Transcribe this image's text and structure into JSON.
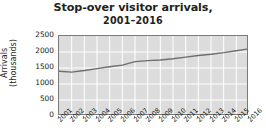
{
  "chart_data": {
    "type": "line",
    "title": "Stop-over visitor arrivals,",
    "subtitle": "2001–2016",
    "xlabel": "",
    "ylabel": "Arrivals",
    "ylabel_line2": "(thousands)",
    "categories": [
      "2001",
      "2002",
      "2003",
      "2004",
      "2005",
      "2006",
      "2007",
      "2008",
      "2009",
      "2010",
      "2011",
      "2012",
      "2013",
      "2014",
      "2015",
      "2016"
    ],
    "values": [
      1400,
      1370,
      1420,
      1480,
      1540,
      1590,
      1700,
      1730,
      1750,
      1790,
      1840,
      1890,
      1930,
      1980,
      2040,
      2100
    ],
    "series": [
      {
        "name": "Stop-over visitor arrivals",
        "values": [
          1400,
          1370,
          1420,
          1480,
          1540,
          1590,
          1700,
          1730,
          1750,
          1790,
          1840,
          1890,
          1930,
          1980,
          2040,
          2100
        ],
        "color": "#6e6e6e"
      }
    ],
    "ylim": [
      0,
      2500
    ],
    "yticks": [
      0,
      500,
      1000,
      1500,
      2000,
      2500
    ],
    "ytick_labels": [
      "0",
      "500",
      "1000",
      "1500",
      "2000",
      "2500"
    ],
    "grid": true,
    "grid_color": "#ffffff",
    "plot_background": "#dcdcdc",
    "legend": "none",
    "legend_position": "none"
  }
}
